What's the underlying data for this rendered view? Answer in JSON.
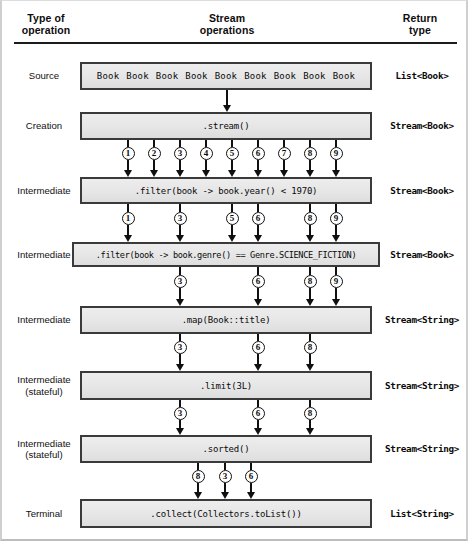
{
  "header": {
    "col_type": [
      "Type of",
      "operation"
    ],
    "col_stream": [
      "Stream",
      "operations"
    ],
    "col_return": [
      "Return",
      "type"
    ]
  },
  "source_items": [
    "Book",
    "Book",
    "Book",
    "Book",
    "Book",
    "Book",
    "Book",
    "Book",
    "Book"
  ],
  "rows": [
    {
      "type": [
        "Source"
      ],
      "operation": "Book Book Book Book Book Book Book Book Book",
      "return_type": "List<Book>",
      "is_source": true
    },
    {
      "type": [
        "Creation"
      ],
      "operation": ".stream()",
      "return_type": "Stream<Book>",
      "is_source": false
    },
    {
      "type": [
        "Intermediate"
      ],
      "operation": ".filter(book -> book.year() < 1970)",
      "return_type": "Stream<Book>",
      "is_source": false
    },
    {
      "type": [
        "Intermediate"
      ],
      "operation": ".filter(book -> book.genre() == Genre.SCIENCE_FICTION)",
      "return_type": "Stream<Book>",
      "is_source": false,
      "wide": true
    },
    {
      "type": [
        "Intermediate"
      ],
      "operation": ".map(Book::title)",
      "return_type": "Stream<String>",
      "is_source": false
    },
    {
      "type": [
        "Intermediate",
        "(stateful)"
      ],
      "operation": ".limit(3L)",
      "return_type": "Stream<String>",
      "is_source": false
    },
    {
      "type": [
        "Intermediate",
        "(stateful)"
      ],
      "operation": ".sorted()",
      "return_type": "Stream<String>",
      "is_source": false
    },
    {
      "type": [
        "Terminal"
      ],
      "operation": ".collect(Collectors.toList())",
      "return_type": "List<String>",
      "is_source": false
    }
  ],
  "flows": [
    {
      "from_row": 0,
      "to_row": 1,
      "tokens": []
    },
    {
      "from_row": 1,
      "to_row": 2,
      "tokens": [
        "1",
        "2",
        "3",
        "4",
        "5",
        "6",
        "7",
        "8",
        "9"
      ]
    },
    {
      "from_row": 2,
      "to_row": 3,
      "tokens": [
        "1",
        "3",
        "5",
        "6",
        "8",
        "9"
      ]
    },
    {
      "from_row": 3,
      "to_row": 4,
      "tokens": [
        "3",
        "6",
        "8",
        "9"
      ]
    },
    {
      "from_row": 4,
      "to_row": 5,
      "tokens": [
        "3",
        "6",
        "8"
      ]
    },
    {
      "from_row": 5,
      "to_row": 6,
      "tokens": [
        "3",
        "6",
        "8"
      ]
    },
    {
      "from_row": 6,
      "to_row": 7,
      "tokens": [
        "8",
        "3",
        "6"
      ]
    }
  ],
  "colors": {
    "box_fill": "#e8e8e8",
    "box_border": "#3a3a3a",
    "line": "#101010",
    "rule": "#1b1b1b",
    "text": "#111111"
  }
}
